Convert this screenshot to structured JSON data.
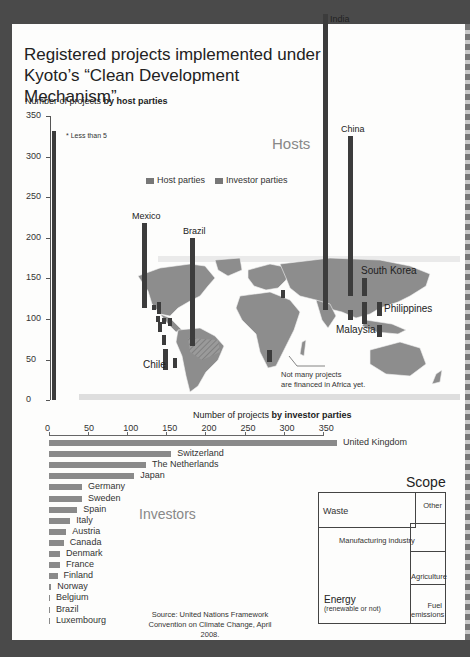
{
  "title_line1": "Registered projects implemented under",
  "title_line2": "Kyoto’s “Clean Development Mechanism”",
  "hosts": {
    "heading": "Hosts",
    "subtitle_prefix": "Number of projects ",
    "subtitle_bold": "by host parties",
    "footnote": "* Less than 5",
    "yticks": [
      "350",
      "300",
      "250",
      "200",
      "150",
      "100",
      "50",
      "0"
    ],
    "legend": {
      "host": "Host parties",
      "investor": "Investor parties"
    },
    "countries": {
      "india": "India",
      "china": "China",
      "mexico": "Mexico",
      "brazil": "Brazil",
      "chile": "Chile",
      "south_korea": "South Korea",
      "philippines": "Philippines",
      "malaysia": "Malaysia"
    },
    "africa_note_1": "Not many projects",
    "africa_note_2": "are financed in Africa yet."
  },
  "investors": {
    "heading": "Investors",
    "subtitle_prefix": "Number of projects ",
    "subtitle_bold": "by investor parties",
    "xticks": [
      "0",
      "50",
      "100",
      "150",
      "200",
      "250",
      "300",
      "350"
    ],
    "items": [
      {
        "name": "United Kingdom",
        "value": 368
      },
      {
        "name": "Switzerland",
        "value": 156
      },
      {
        "name": "The Netherlands",
        "value": 124
      },
      {
        "name": "Japan",
        "value": 109
      },
      {
        "name": "Germany",
        "value": 42
      },
      {
        "name": "Sweden",
        "value": 42
      },
      {
        "name": "Spain",
        "value": 36
      },
      {
        "name": "Italy",
        "value": 27
      },
      {
        "name": "Austria",
        "value": 22
      },
      {
        "name": "Canada",
        "value": 19
      },
      {
        "name": "Denmark",
        "value": 14
      },
      {
        "name": "France",
        "value": 14
      },
      {
        "name": "Finland",
        "value": 11
      },
      {
        "name": "Norway",
        "value": 3
      },
      {
        "name": "Belgium",
        "value": 1
      },
      {
        "name": "Brazil",
        "value": 1
      },
      {
        "name": "Luxembourg",
        "value": 1
      }
    ]
  },
  "scope": {
    "heading": "Scope",
    "waste": "Waste",
    "other": "Other",
    "manufacturing": "Manufacturing industry",
    "agriculture": "Agriculture",
    "energy": "Energy",
    "energy_sub": "(renewable or not)",
    "fuel_1": "Fuel",
    "fuel_2": "emissions"
  },
  "source_1": "Source: United Nations Framework",
  "source_2": "Convention on Climate Change, April 2008.",
  "colors": {
    "host_bar": "#3c3c3c",
    "investor_bar": "#8a8a8a",
    "map_land": "#8d8d8d",
    "background": "#4a4a4a"
  },
  "chart_data": [
    {
      "type": "bar",
      "title": "Number of projects by host parties",
      "ylabel": "Number of projects",
      "ylim": [
        0,
        350
      ],
      "yticks": [
        0,
        50,
        100,
        150,
        200,
        250,
        300,
        350
      ],
      "categories": [
        "India",
        "China",
        "Brazil",
        "Mexico",
        "Chile",
        "South Korea",
        "Malaysia",
        "Philippines"
      ],
      "values": [
        330,
        197,
        132,
        105,
        25,
        20,
        20,
        12
      ],
      "legend": [
        "Host parties",
        "Investor parties"
      ],
      "annotations": [
        "* Less than 5",
        "Not many projects are financed in Africa yet."
      ]
    },
    {
      "type": "bar",
      "orientation": "horizontal",
      "title": "Number of projects by investor parties",
      "xlim": [
        0,
        350
      ],
      "xticks": [
        0,
        50,
        100,
        150,
        200,
        250,
        300,
        350
      ],
      "categories": [
        "United Kingdom",
        "Switzerland",
        "The Netherlands",
        "Japan",
        "Germany",
        "Sweden",
        "Spain",
        "Italy",
        "Austria",
        "Canada",
        "Denmark",
        "France",
        "Finland",
        "Norway",
        "Belgium",
        "Brazil",
        "Luxembourg"
      ],
      "values": [
        368,
        156,
        124,
        109,
        42,
        42,
        36,
        27,
        22,
        19,
        14,
        14,
        11,
        3,
        1,
        1,
        1
      ]
    },
    {
      "type": "treemap",
      "title": "Scope",
      "categories": [
        "Energy (renewable or not)",
        "Waste",
        "Manufacturing industry",
        "Agriculture",
        "Fuel emissions",
        "Other"
      ]
    }
  ]
}
